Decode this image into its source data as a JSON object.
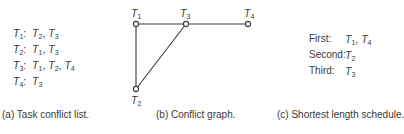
{
  "panel_a": {
    "caption": "(a)  Task conflict list.",
    "rows": [
      {
        "task": "T",
        "task_sub": "1",
        "conflicts": [
          {
            "t": "T",
            "s": "2"
          },
          {
            "t": "T",
            "s": "3"
          }
        ]
      },
      {
        "task": "T",
        "task_sub": "2",
        "conflicts": [
          {
            "t": "T",
            "s": "1"
          },
          {
            "t": "T",
            "s": "3"
          }
        ]
      },
      {
        "task": "T",
        "task_sub": "3",
        "conflicts": [
          {
            "t": "T",
            "s": "1"
          },
          {
            "t": "T",
            "s": "2"
          },
          {
            "t": "T",
            "s": "4"
          }
        ]
      },
      {
        "task": "T",
        "task_sub": "4",
        "conflicts": [
          {
            "t": "T",
            "s": "3"
          }
        ]
      }
    ]
  },
  "panel_b": {
    "caption": "(b)  Conflict graph.",
    "nodes": [
      {
        "id": "T1",
        "label": "T",
        "sub": "1",
        "x": 136,
        "y": 24
      },
      {
        "id": "T3",
        "label": "T",
        "sub": "3",
        "x": 186,
        "y": 24
      },
      {
        "id": "T4",
        "label": "T",
        "sub": "4",
        "x": 248,
        "y": 24
      },
      {
        "id": "T2",
        "label": "T",
        "sub": "2",
        "x": 136,
        "y": 89
      }
    ],
    "edges": [
      [
        "T1",
        "T3"
      ],
      [
        "T3",
        "T4"
      ],
      [
        "T1",
        "T2"
      ],
      [
        "T2",
        "T3"
      ]
    ]
  },
  "panel_c": {
    "caption": "(c)  Shortest length schedule.",
    "rows": [
      {
        "label": "First:",
        "tasks": [
          {
            "t": "T",
            "s": "1"
          },
          {
            "t": "T",
            "s": "4"
          }
        ]
      },
      {
        "label": "Second:",
        "tasks": [
          {
            "t": "T",
            "s": "2"
          }
        ]
      },
      {
        "label": "Third:",
        "tasks": [
          {
            "t": "T",
            "s": "3"
          }
        ]
      }
    ]
  },
  "colors": {
    "ink": "#3a3a3a",
    "background": "#ffffff"
  }
}
